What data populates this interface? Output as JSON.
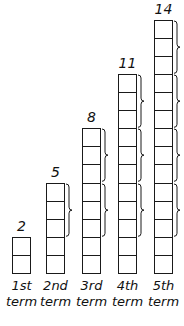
{
  "terms": [
    {
      "value": "2",
      "label_1": "1st",
      "label_2": "term",
      "squares": 2
    },
    {
      "value": "5",
      "label_1": "2nd",
      "label_2": "term",
      "squares": 5
    },
    {
      "value": "8",
      "label_1": "3rd",
      "label_2": "term",
      "squares": 8
    },
    {
      "value": "11",
      "label_1": "4th",
      "label_2": "term",
      "squares": 11
    },
    {
      "value": "14",
      "label_1": "5th",
      "label_2": "term",
      "squares": 14
    }
  ],
  "brace_group_size": 3,
  "colors": {
    "stroke": "#1a1a1a",
    "fill": "#ffffff"
  }
}
